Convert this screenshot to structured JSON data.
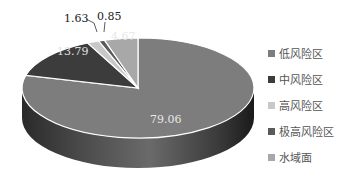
{
  "chart_data": {
    "type": "pie",
    "style": "3d",
    "title": "",
    "categories": [
      "低风险区",
      "中风险区",
      "高风险区",
      "极高风险区",
      "水域面"
    ],
    "values": [
      79.06,
      13.79,
      1.63,
      0.85,
      4.67
    ],
    "unit": "%",
    "colors": [
      "#7d7d7d",
      "#3c3c3c",
      "#c8c8c8",
      "#5a5a5a",
      "#a8a8a8"
    ],
    "data_labels": [
      "79.06",
      "13.79",
      "1.63",
      "0.85",
      "4.67"
    ],
    "legend_position": "right",
    "start_angle": "12 o'clock",
    "direction": "clockwise"
  },
  "legend": [
    {
      "label": "低风险区",
      "color": "#7d7d7d"
    },
    {
      "label": "中风险区",
      "color": "#3c3c3c"
    },
    {
      "label": "高风险区",
      "color": "#c8c8c8"
    },
    {
      "label": "极高风险区",
      "color": "#5a5a5a"
    },
    {
      "label": "水域面",
      "color": "#a8a8a8"
    }
  ]
}
